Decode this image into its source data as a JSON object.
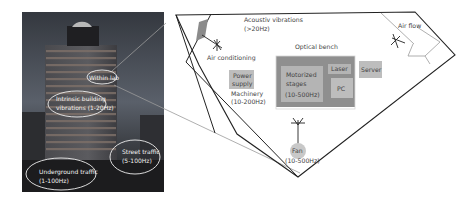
{
  "photo": {
    "labels": {
      "within_lab": "Within lab",
      "intrinsic_line1": "Intrinsic building",
      "intrinsic_line2": "vibrations (1-20Hz)",
      "street_line1": "Street traffic",
      "street_line2": "(5-100Hz)",
      "underground_line1": "Underground traffic",
      "underground_line2": "(1-100Hz)"
    }
  },
  "lab": {
    "acoustic_line1": "Acoustiv vibrations",
    "acoustic_line2": "(>20Hz)",
    "air_conditioning": "Air conditioning",
    "optical_bench": "Optical bench",
    "power_line1": "Power",
    "power_line2": "supply",
    "machinery_line1": "Machinery",
    "machinery_line2": "(10-200Hz)",
    "motorized_line1": "Motorized",
    "motorized_line2": "stages",
    "motorized_line3": "(10-500Hz)",
    "laser": "Laser",
    "pc": "PC",
    "server": "Server",
    "air_flow": "Air flow",
    "fan_line1": "Fan",
    "fan_line2": "(10-500Hz)"
  },
  "colors": {
    "outline": "#222222",
    "photo_sky_top": "#3a3f48",
    "box_gray": "#bdbdbd",
    "bench_dark": "#8f8f8f",
    "fan_circle": "#c8c8c8",
    "ellipse": "#f0f0f0"
  }
}
